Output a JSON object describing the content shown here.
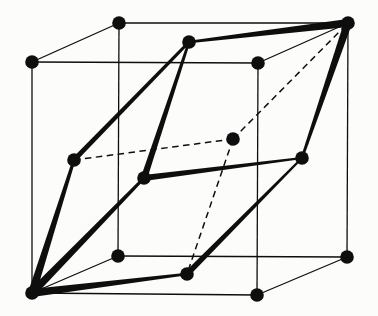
{
  "figure": {
    "name": "fcc-lattice-primitive-rhombohedral-cell",
    "background_color": "#fcfcfa",
    "ink_color": "#0e0e0e",
    "canvas": {
      "width": 378,
      "height": 316
    },
    "atom_radius": 6.8,
    "thin_line_width": 1.3,
    "dashed_line_width": 1.5,
    "dash_pattern": "6.5 4.5",
    "nodes": {
      "corner-front-top-left": [
        32,
        62
      ],
      "corner-back-top-left": [
        119,
        23
      ],
      "corner-back-top-right": [
        348,
        23
      ],
      "corner-front-top-right": [
        258,
        63
      ],
      "corner-front-bottom-left": [
        32,
        293
      ],
      "corner-back-bottom-left": [
        118,
        256
      ],
      "corner-back-bottom-right": [
        347,
        257
      ],
      "corner-front-bottom-right": [
        257,
        295
      ],
      "face-top": [
        189,
        42
      ],
      "face-bottom": [
        187,
        274
      ],
      "face-front": [
        144,
        178
      ],
      "face-back": [
        233,
        139
      ],
      "face-left": [
        74,
        160
      ],
      "face-right": [
        302,
        158
      ]
    },
    "cube_edges": [
      [
        "corner-front-top-left",
        "corner-back-top-left"
      ],
      [
        "corner-back-top-left",
        "corner-back-top-right"
      ],
      [
        "corner-back-top-right",
        "corner-front-top-right"
      ],
      [
        "corner-front-top-right",
        "corner-front-top-left"
      ],
      [
        "corner-front-bottom-left",
        "corner-back-bottom-left"
      ],
      [
        "corner-back-bottom-left",
        "corner-back-bottom-right"
      ],
      [
        "corner-back-bottom-right",
        "corner-front-bottom-right"
      ],
      [
        "corner-front-bottom-right",
        "corner-front-bottom-left"
      ],
      [
        "corner-front-top-left",
        "corner-front-bottom-left"
      ],
      [
        "corner-back-top-left",
        "corner-back-bottom-left"
      ],
      [
        "corner-back-top-right",
        "corner-back-bottom-right"
      ],
      [
        "corner-front-top-right",
        "corner-front-bottom-right"
      ]
    ],
    "primitive_edges_visible": [
      {
        "from": "corner-front-bottom-left",
        "to": "face-bottom",
        "w1": 8,
        "w2": 2.5
      },
      {
        "from": "corner-front-bottom-left",
        "to": "face-front",
        "w1": 8,
        "w2": 3
      },
      {
        "from": "corner-front-bottom-left",
        "to": "face-left",
        "w1": 8,
        "w2": 3
      },
      {
        "from": "face-front",
        "to": "face-top",
        "w1": 6.5,
        "w2": 2.5
      },
      {
        "from": "face-front",
        "to": "face-right",
        "w1": 6,
        "w2": 2
      },
      {
        "from": "face-bottom",
        "to": "face-right",
        "w1": 6,
        "w2": 2
      },
      {
        "from": "face-left",
        "to": "face-top",
        "w1": 5,
        "w2": 3
      },
      {
        "from": "corner-back-top-right",
        "to": "face-top",
        "w1": 8,
        "w2": 2.5
      },
      {
        "from": "corner-back-top-right",
        "to": "face-right",
        "w1": 8,
        "w2": 2.5
      }
    ],
    "primitive_edges_hidden": [
      [
        "face-left",
        "face-back"
      ],
      [
        "face-back",
        "face-bottom"
      ],
      [
        "face-back",
        "corner-back-top-right"
      ]
    ]
  }
}
